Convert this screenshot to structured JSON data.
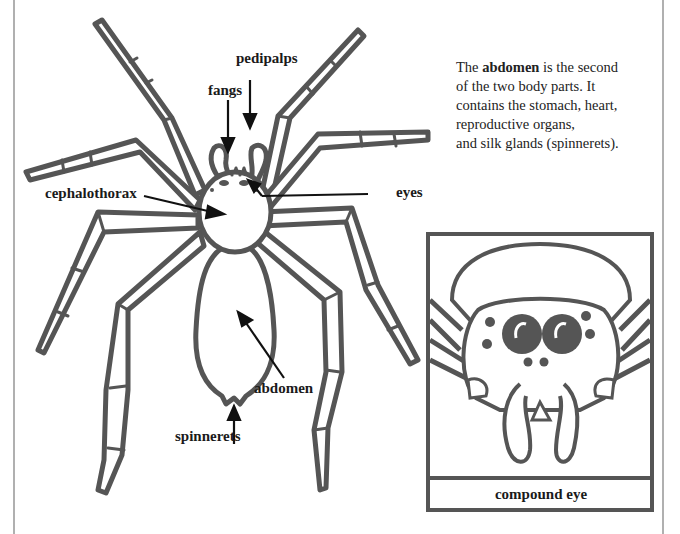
{
  "top_text_fragment": "… … … … … … … … …",
  "labels": {
    "pedipalps": "pedipalps",
    "fangs": "fangs",
    "cephalothorax": "cephalothorax",
    "eyes": "eyes",
    "abdomen": "abdomen",
    "spinnerets": "spinnerets"
  },
  "description": {
    "before": "The ",
    "bold": "abdomen",
    "after_line1": " is the second",
    "line2": "of the two body parts.  It",
    "line3": "contains the stomach, heart,",
    "line4": "reproductive organs,",
    "line5": "and silk glands (spinnerets)."
  },
  "inset": {
    "caption": "compound eye"
  },
  "colors": {
    "outline": "#555555",
    "text": "#1a1a1a",
    "border": "#b0b0b0"
  }
}
